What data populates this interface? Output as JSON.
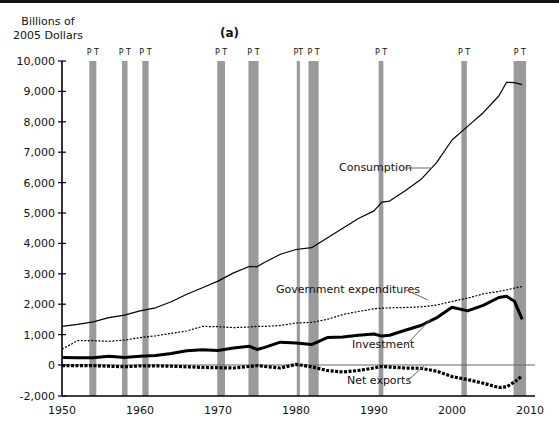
{
  "chart_data": {
    "type": "line",
    "title": "(a)",
    "ylabel": "Billions of 2005 Dollars",
    "ylabel_lines": [
      "Billions of",
      "2005 Dollars"
    ],
    "xlabel": "",
    "xlim": [
      1950,
      2010
    ],
    "ylim": [
      -2000,
      10000
    ],
    "x_ticks": [
      "1950",
      "1960",
      "1970",
      "1980",
      "1990",
      "2000",
      "2010"
    ],
    "y_ticks": [
      "10,000",
      "9,000",
      "8,000",
      "7,000",
      "6,000",
      "5,000",
      "4,000",
      "3,000",
      "2,000",
      "1,000",
      "0",
      "-2,000"
    ],
    "grid": false,
    "legend": "inline labels",
    "recessions": [
      {
        "peak": 1953.5,
        "trough": 1954.4,
        "label": "P T"
      },
      {
        "peak": 1957.7,
        "trough": 1958.4,
        "label": "P T"
      },
      {
        "peak": 1960.3,
        "trough": 1961.1,
        "label": "P T"
      },
      {
        "peak": 1969.9,
        "trough": 1970.9,
        "label": "P T"
      },
      {
        "peak": 1973.9,
        "trough": 1975.2,
        "label": "P T"
      },
      {
        "peak": 1980.1,
        "trough": 1980.5,
        "label": "PT"
      },
      {
        "peak": 1981.6,
        "trough": 1982.9,
        "label": "P T"
      },
      {
        "peak": 1990.6,
        "trough": 1991.2,
        "label": "P T"
      },
      {
        "peak": 2001.2,
        "trough": 2001.9,
        "label": "P T"
      },
      {
        "peak": 2007.9,
        "trough": 2009.5,
        "label": "P T"
      }
    ],
    "x": [
      1950,
      1952,
      1954,
      1956,
      1958,
      1960,
      1962,
      1964,
      1966,
      1968,
      1970,
      1972,
      1974,
      1975,
      1976,
      1978,
      1980,
      1982,
      1984,
      1986,
      1988,
      1990,
      1991,
      1992,
      1994,
      1996,
      1998,
      2000,
      2002,
      2004,
      2006,
      2007,
      2008,
      2009
    ],
    "series": [
      {
        "name": "Consumption",
        "style": "solid-thin",
        "values": [
          1270,
          1340,
          1420,
          1560,
          1640,
          1780,
          1880,
          2080,
          2330,
          2540,
          2760,
          3030,
          3240,
          3230,
          3380,
          3640,
          3800,
          3860,
          4180,
          4500,
          4820,
          5070,
          5360,
          5390,
          5730,
          6100,
          6650,
          7400,
          7850,
          8300,
          8850,
          9300,
          9290,
          9220
        ]
      },
      {
        "name": "Government expenditures",
        "style": "dotted-thin",
        "values": [
          520,
          800,
          800,
          780,
          820,
          900,
          960,
          1040,
          1120,
          1270,
          1260,
          1230,
          1250,
          1270,
          1270,
          1300,
          1380,
          1400,
          1500,
          1660,
          1760,
          1850,
          1870,
          1880,
          1890,
          1910,
          1970,
          2090,
          2200,
          2340,
          2420,
          2470,
          2530,
          2580
        ]
      },
      {
        "name": "Investment",
        "style": "solid-thick",
        "values": [
          250,
          240,
          240,
          290,
          250,
          290,
          310,
          380,
          470,
          500,
          480,
          560,
          620,
          510,
          580,
          750,
          720,
          670,
          900,
          920,
          980,
          1020,
          950,
          980,
          1140,
          1300,
          1550,
          1900,
          1780,
          1960,
          2220,
          2260,
          2100,
          1500
        ]
      },
      {
        "name": "Net exports",
        "style": "dotted-thick",
        "values": [
          -20,
          -20,
          -20,
          -40,
          -60,
          -30,
          -30,
          -40,
          -60,
          -80,
          -90,
          -100,
          -50,
          -20,
          -50,
          -100,
          20,
          -60,
          -180,
          -230,
          -180,
          -100,
          -50,
          -70,
          -100,
          -110,
          -200,
          -380,
          -480,
          -600,
          -740,
          -720,
          -560,
          -360
        ]
      }
    ],
    "annotations": [
      "Consumption",
      "Government expenditures",
      "Investment",
      "Net exports"
    ]
  }
}
